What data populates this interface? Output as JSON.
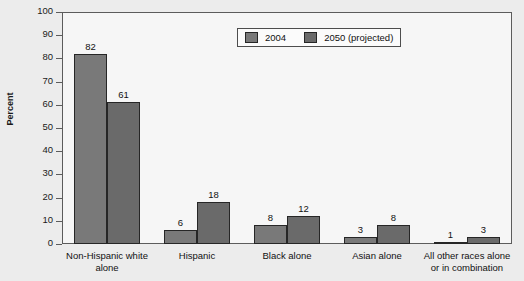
{
  "chart_data": {
    "type": "bar",
    "title": "",
    "subtitle": "",
    "xlabel": "",
    "ylabel": "Percent",
    "ylim": [
      0,
      100
    ],
    "y_ticks": [
      0,
      10,
      20,
      30,
      40,
      50,
      60,
      70,
      80,
      90,
      100
    ],
    "grid": false,
    "legend_position": "top-center",
    "categories": [
      "Non-Hispanic white\nalone",
      "Hispanic",
      "Black alone",
      "Asian alone",
      "All other races alone\nor in combination"
    ],
    "series": [
      {
        "name": "2004",
        "color": "#797979",
        "values": [
          82,
          6,
          8,
          3,
          1
        ]
      },
      {
        "name": "2050 (projected)",
        "color": "#6a6a6a",
        "values": [
          61,
          18,
          12,
          8,
          3
        ]
      }
    ],
    "data_labels": [
      [
        "82",
        "6",
        "8",
        "3",
        "1"
      ],
      [
        "61",
        "18",
        "12",
        "8",
        "3"
      ]
    ]
  },
  "legend": {
    "entries": [
      {
        "label": "2004"
      },
      {
        "label": "2050 (projected)"
      }
    ]
  },
  "axis": {
    "y_title": "Percent",
    "y_tick_labels": [
      "100",
      "90",
      "80",
      "70",
      "60",
      "50",
      "40",
      "30",
      "20",
      "10",
      "0"
    ]
  },
  "colors": {
    "series_2004": "#797979",
    "series_2050": "#6a6a6a",
    "plot_background": "#f6f6f6",
    "page_background": "#ececec",
    "axis_line": "#5c5c5c",
    "bar_border": "#262626"
  }
}
